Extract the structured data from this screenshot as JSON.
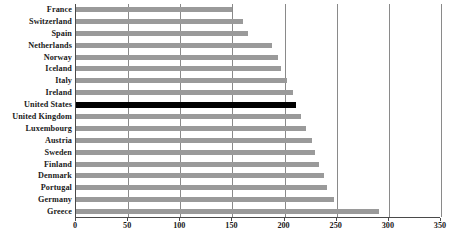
{
  "chart_data": {
    "type": "bar",
    "orientation": "horizontal",
    "title": "",
    "xlabel": "",
    "ylabel": "",
    "xlim": [
      0,
      350
    ],
    "xticks": [
      0,
      50,
      100,
      150,
      200,
      250,
      300,
      350
    ],
    "grid": true,
    "legend": false,
    "highlight_category": "United States",
    "highlight_color": "#000000",
    "bar_color": "#9a9a9a",
    "categories": [
      "France",
      "Switzerland",
      "Spain",
      "Netherlands",
      "Norway",
      "Iceland",
      "Italy",
      "Ireland",
      "United States",
      "United Kingdom",
      "Luxembourg",
      "Austria",
      "Sweden",
      "Finland",
      "Denmark",
      "Portugal",
      "Germany",
      "Greece"
    ],
    "values": [
      150,
      160,
      165,
      188,
      194,
      197,
      202,
      208,
      211,
      216,
      221,
      226,
      229,
      233,
      238,
      241,
      247,
      291
    ]
  }
}
